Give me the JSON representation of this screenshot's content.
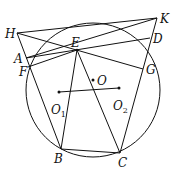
{
  "diagram": {
    "type": "geometry",
    "circle": {
      "cx": 93,
      "cy": 90,
      "r": 67
    },
    "points": {
      "H": [
        17,
        33
      ],
      "K": [
        157,
        18
      ],
      "D": [
        150,
        38
      ],
      "E": [
        77,
        50
      ],
      "A": [
        26,
        58
      ],
      "F": [
        28,
        67
      ],
      "G": [
        143,
        69
      ],
      "B": [
        61,
        149
      ],
      "C": [
        120,
        153
      ],
      "O": [
        93,
        80
      ],
      "O1": [
        59,
        92
      ],
      "O2": [
        119,
        88
      ]
    },
    "segments": [
      [
        "H",
        "K"
      ],
      [
        "H",
        "G"
      ],
      [
        "H",
        "B"
      ],
      [
        "K",
        "A"
      ],
      [
        "K",
        "C"
      ],
      [
        "A",
        "D"
      ],
      [
        "F",
        "E"
      ],
      [
        "E",
        "B"
      ],
      [
        "E",
        "C"
      ],
      [
        "B",
        "C"
      ],
      [
        "O1",
        "O2"
      ],
      [
        "E",
        "D"
      ]
    ],
    "labels": {
      "H": "H",
      "K": "K",
      "D": "D",
      "E": "E",
      "A": "A",
      "F": "F",
      "G": "G",
      "B": "B",
      "C": "C",
      "O": "O",
      "O1": "O",
      "O1_sub": "1",
      "O2": "O",
      "O2_sub": "2"
    },
    "colors": {
      "stroke": "#111111",
      "background": "#ffffff"
    }
  }
}
